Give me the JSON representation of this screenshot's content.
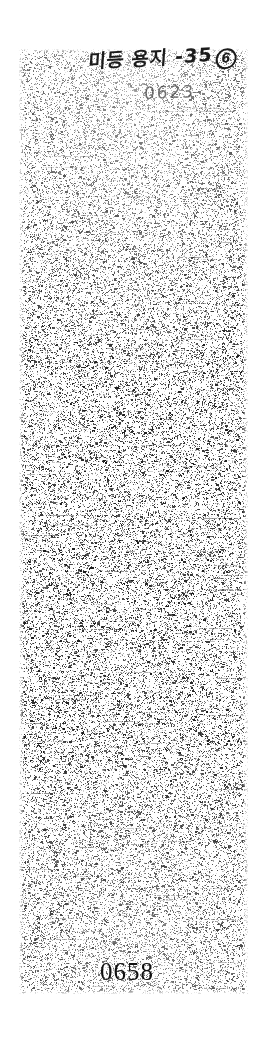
{
  "document": {
    "kind": "scanned-page",
    "background_color": "#ffffff",
    "ink_color": "#1b1b1b",
    "page_width": 266,
    "page_height": 1038
  },
  "scan": {
    "region_label": "scanned-noise-region",
    "left": 18,
    "top": 48,
    "width": 231,
    "height": 947,
    "description": "heavily degraded speckled scan area"
  },
  "annotation": {
    "handwritten_line": "미등 용지 -35",
    "circled_mark": "6",
    "stamp_number": "0623"
  },
  "footer": {
    "page_number": "0658"
  }
}
